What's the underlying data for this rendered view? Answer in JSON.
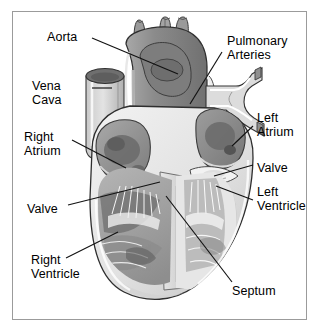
{
  "figure": {
    "style": "grayscale line illustration with leader-line callouts",
    "border_color": "#9b9b9b",
    "background": "#ffffff"
  },
  "labels": [
    {
      "id": "aorta",
      "text": "Aorta",
      "lines": [
        "Aorta"
      ],
      "align": "left",
      "x": 47,
      "y": 31
    },
    {
      "id": "vena-cava",
      "text": "Vena Cava",
      "lines": [
        "Vena",
        "Cava"
      ],
      "align": "left",
      "x": 32,
      "y": 80
    },
    {
      "id": "right-atrium",
      "text": "Right Atrium",
      "lines": [
        "Right",
        "Atrium"
      ],
      "align": "left",
      "x": 24,
      "y": 131
    },
    {
      "id": "valve-left",
      "text": "Valve",
      "lines": [
        "Valve"
      ],
      "align": "left",
      "x": 27,
      "y": 203
    },
    {
      "id": "right-ventricle",
      "text": "Right Ventricle",
      "lines": [
        "Right",
        "Ventricle"
      ],
      "align": "left",
      "x": 31,
      "y": 254
    },
    {
      "id": "pulmonary-arteries",
      "text": "Pulmonary Arteries",
      "lines": [
        "Pulmonary",
        "Arteries"
      ],
      "align": "left",
      "x": 227,
      "y": 35
    },
    {
      "id": "left-atrium",
      "text": "Left Atrium",
      "lines": [
        "Left",
        "Atrium"
      ],
      "align": "left",
      "x": 257,
      "y": 112
    },
    {
      "id": "valve-right",
      "text": "Valve",
      "lines": [
        "Valve"
      ],
      "align": "left",
      "x": 257,
      "y": 162
    },
    {
      "id": "left-ventricle",
      "text": "Left Ventricle",
      "lines": [
        "Left",
        "Ventricle"
      ],
      "align": "left",
      "x": 257,
      "y": 186
    },
    {
      "id": "septum",
      "text": "Septum",
      "lines": [
        "Septum"
      ],
      "align": "left",
      "x": 232,
      "y": 285
    }
  ],
  "palette": {
    "outline": "#2b2b2b",
    "leader_line": "#111111",
    "aorta_body": "#8d8d8d",
    "aorta_dark": "#6d6d6d",
    "vessel_light": "#d8d8d8",
    "chamber_light": "#e7e7e7",
    "chamber_mid": "#bdbdbd",
    "chamber_dark": "#7e7e7e",
    "muscle_pale": "#efefef",
    "septum": "#dcdcdc"
  },
  "structures": [
    "aortic arch",
    "brachiocephalic vessel stubs",
    "superior vena cava",
    "pulmonary artery bifurcation",
    "right atrium",
    "left atrium",
    "tricuspid valve",
    "mitral valve",
    "right ventricle",
    "left ventricle",
    "interventricular septum",
    "trabeculae carneae",
    "chordae tendineae",
    "papillary muscles"
  ]
}
